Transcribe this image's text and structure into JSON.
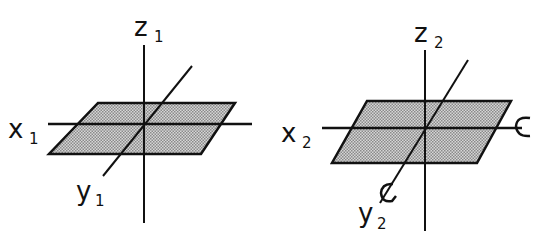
{
  "diagram": {
    "frames": [
      {
        "id": 1,
        "labels": {
          "z": "z",
          "z_sub": "1",
          "x": "x",
          "x_sub": "1",
          "y": "y",
          "y_sub": "1"
        },
        "rotation_arrows": false
      },
      {
        "id": 2,
        "labels": {
          "z": "z",
          "z_sub": "2",
          "x": "x",
          "x_sub": "2",
          "y": "y",
          "y_sub": "2"
        },
        "rotation_arrows": true
      }
    ],
    "colors": {
      "line": "#111111",
      "plane_fill": "#b5b5b5",
      "background": "#ffffff"
    }
  }
}
